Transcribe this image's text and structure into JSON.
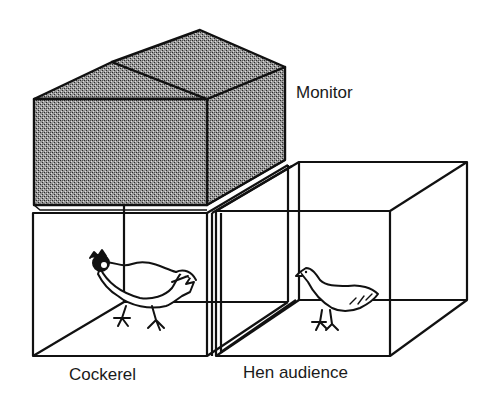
{
  "figure": {
    "type": "schematic",
    "colors": {
      "line": "#111111",
      "monitor_fill": "#8a8a8a",
      "background": "#ffffff"
    }
  },
  "labels": {
    "monitor": "Monitor",
    "cockerel": "Cockerel",
    "hen_audience": "Hen audience"
  },
  "components": [
    {
      "id": "monitor",
      "shape": "shaded-box-with-pitched-roof"
    },
    {
      "id": "cockerel-cage",
      "shape": "wire-cube",
      "contains": "cockerel"
    },
    {
      "id": "hen-cage",
      "shape": "wire-cube",
      "contains": "hen"
    }
  ]
}
